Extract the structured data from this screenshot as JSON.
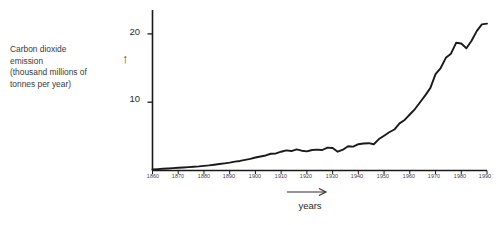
{
  "page": {
    "background_color": "#ffffff",
    "ink_color": "#1a1a1a",
    "top_clipped_fragment": "·  ·           ·        ·      · ·"
  },
  "axis_caption": {
    "y_line_1": "Carbon dioxide",
    "y_line_2": "emission",
    "y_line_3": "(thousand millions of",
    "y_line_4": "tonnes per year)",
    "y_arrow_glyph": "↑",
    "x_label": "years",
    "x_arrow_glyph": "→"
  },
  "chart_data": {
    "type": "line",
    "title": "",
    "subtitle": "",
    "xlabel": "years",
    "ylabel": "Carbon dioxide emission (thousand millions of tonnes per year)",
    "xlim": [
      1860,
      1990
    ],
    "ylim": [
      0,
      23.5
    ],
    "xticks": [
      1860,
      1870,
      1880,
      1890,
      1900,
      1910,
      1920,
      1930,
      1940,
      1950,
      1960,
      1970,
      1980,
      1990
    ],
    "xtick_labels": [
      "1860",
      "1870",
      "1880",
      "1890",
      "1900",
      "1910",
      "1920",
      "1930",
      "1940",
      "1950",
      "1960",
      "1970",
      "1980",
      "1990"
    ],
    "yticks": [
      10,
      20
    ],
    "ytick_labels": [
      "10",
      "20"
    ],
    "grid": false,
    "legend": null,
    "legend_position": "none",
    "line_color": "#1a1a1a",
    "line_width_px": 1.9,
    "series": [
      {
        "name": "Global CO2 emission",
        "x": [
          1860,
          1862,
          1864,
          1866,
          1868,
          1870,
          1872,
          1874,
          1876,
          1878,
          1880,
          1882,
          1884,
          1886,
          1888,
          1890,
          1892,
          1894,
          1896,
          1898,
          1900,
          1902,
          1904,
          1906,
          1908,
          1910,
          1912,
          1914,
          1916,
          1918,
          1920,
          1922,
          1924,
          1926,
          1928,
          1930,
          1932,
          1934,
          1936,
          1938,
          1940,
          1942,
          1944,
          1946,
          1948,
          1950,
          1952,
          1954,
          1956,
          1958,
          1960,
          1962,
          1964,
          1966,
          1968,
          1970,
          1972,
          1974,
          1976,
          1978,
          1980,
          1982,
          1984,
          1986,
          1988,
          1990
        ],
        "y": [
          0.15,
          0.2,
          0.25,
          0.3,
          0.35,
          0.4,
          0.45,
          0.5,
          0.55,
          0.6,
          0.68,
          0.75,
          0.85,
          0.95,
          1.05,
          1.15,
          1.3,
          1.4,
          1.55,
          1.7,
          1.9,
          2.05,
          2.2,
          2.45,
          2.5,
          2.75,
          2.95,
          2.85,
          3.1,
          2.9,
          2.8,
          3.0,
          3.05,
          3.0,
          3.35,
          3.3,
          2.75,
          3.05,
          3.55,
          3.5,
          3.85,
          3.95,
          4.0,
          3.85,
          4.6,
          5.1,
          5.6,
          6.0,
          6.9,
          7.4,
          8.2,
          9.0,
          10.0,
          11.0,
          12.1,
          14.1,
          15.0,
          16.5,
          17.1,
          18.7,
          18.6,
          17.9,
          19.0,
          20.4,
          21.4,
          21.5
        ]
      }
    ],
    "annotations": [
      {
        "label": "WWI dip",
        "year": 1918,
        "value": 2.9
      },
      {
        "label": "Great Depression dip",
        "year": 1932,
        "value": 2.75
      },
      {
        "label": "WWII end dip",
        "year": 1946,
        "value": 3.85
      },
      {
        "label": "post-war steep rise",
        "year": 1973,
        "value": 16.0
      },
      {
        "label": "oil crisis dip",
        "year": 1983,
        "value": 17.9
      },
      {
        "label": "late plateau",
        "year": 1989,
        "value": 21.5
      }
    ]
  }
}
